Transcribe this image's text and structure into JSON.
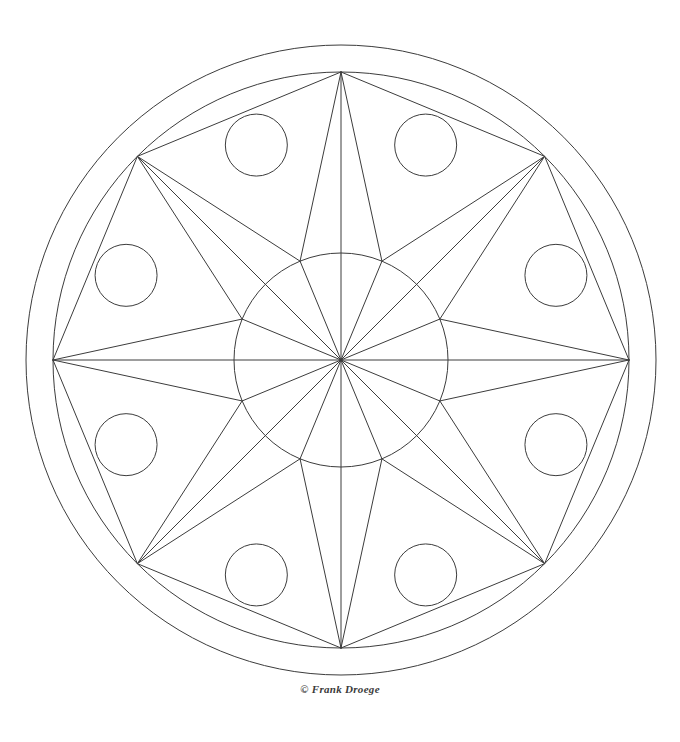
{
  "page": {
    "width": 680,
    "height": 742,
    "background_color": "#ffffff",
    "line_color": "#3c3c3c",
    "line_width": 1
  },
  "credit": {
    "text": "© Frank Droege",
    "symbol": "©",
    "name": "Frank Droege"
  },
  "artwork": {
    "kind": "mandala-line-drawing",
    "center_x": 341,
    "center_y": 360,
    "outer_ring_radius": 315,
    "inner_ring_radius": 288,
    "core_circle_radius": 107,
    "star_points": 8,
    "star_tip_radius": 288,
    "decor_circle_count": 8,
    "decor_circle_orbit_radius": 231,
    "decor_circle_radius": 31,
    "decor_circle_angle_offset_deg": 21.5,
    "tip_angles_deg": [
      270,
      315,
      0,
      45,
      90,
      135,
      180,
      225
    ],
    "decor_angles_deg": [
      248.5,
      291.5,
      338.5,
      21.5,
      68.5,
      111.5,
      158.5,
      201.5
    ]
  }
}
